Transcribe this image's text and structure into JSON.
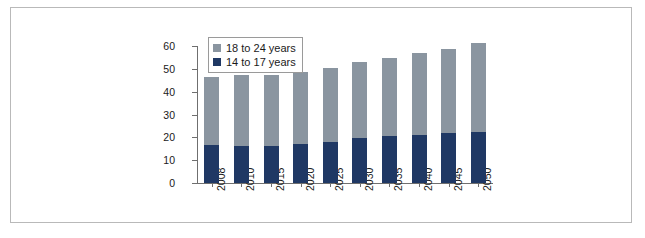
{
  "chart_data": {
    "type": "bar",
    "subtype": "stacked-vertical-bar",
    "title": "",
    "xlabel": "",
    "ylabel": "",
    "categories": [
      "2008",
      "2010",
      "2015",
      "2020",
      "2025",
      "2030",
      "2035",
      "2040",
      "2045",
      "2050"
    ],
    "series": [
      {
        "name": "14 to 17 years",
        "color": "#1f3864",
        "values": [
          16.5,
          16.0,
          16.0,
          17.0,
          18.0,
          19.5,
          20.5,
          21.0,
          22.0,
          22.5
        ]
      },
      {
        "name": "18 to 24 years",
        "color": "#8a95a0",
        "values": [
          30.0,
          31.5,
          31.5,
          31.5,
          32.5,
          33.5,
          34.5,
          36.0,
          37.0,
          39.0
        ]
      }
    ],
    "totals": [
      46.5,
      47.5,
      47.5,
      48.5,
      50.5,
      53.0,
      55.0,
      57.0,
      59.0,
      61.5
    ],
    "ylim": [
      0,
      60
    ],
    "yticks": [
      "0",
      "10",
      "20",
      "30",
      "40",
      "50",
      "60"
    ],
    "ytick_values": [
      0,
      10,
      20,
      30,
      40,
      50,
      60
    ],
    "grid": false,
    "legend_position": "top-left",
    "xtick_rotation": -90
  },
  "legend": {
    "entries": [
      {
        "label": "18 to 24 years",
        "color": "#8a95a0"
      },
      {
        "label": "14 to 17 years",
        "color": "#1f3864"
      }
    ]
  },
  "colors": {
    "series_upper": "#8a95a0",
    "series_lower": "#1f3864",
    "axis": "#6f6f6f",
    "frame_border": "#b9b9b9",
    "text": "#1a1a1a",
    "background": "#ffffff"
  }
}
